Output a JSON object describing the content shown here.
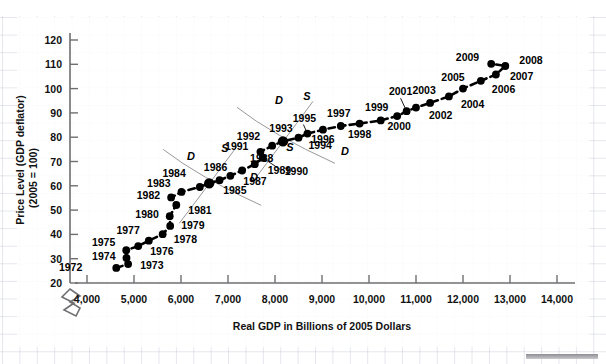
{
  "chart_data": {
    "type": "scatter",
    "title": "",
    "xlabel": "Real GDP in Billions of 2005 Dollars",
    "ylabel_line1": "Price Level (GDP deflator)",
    "ylabel_line2": "(2005 = 100)",
    "xlim": [
      3600,
      14600
    ],
    "ylim": [
      15,
      126
    ],
    "xticks": [
      4000,
      5000,
      6000,
      7000,
      8000,
      9000,
      10000,
      11000,
      12000,
      13000,
      14000
    ],
    "xtick_labels": [
      "4,000",
      "5,000",
      "6,000",
      "7,000",
      "8,000",
      "9,000",
      "10,000",
      "11,000",
      "12,000",
      "13,000",
      "14,000"
    ],
    "yticks": [
      20,
      30,
      40,
      50,
      60,
      70,
      80,
      90,
      100,
      110,
      120
    ],
    "ytick_labels": [
      "20",
      "30",
      "40",
      "50",
      "60",
      "70",
      "80",
      "90",
      "100",
      "110",
      "120"
    ],
    "grid": false,
    "axis_break_x": true,
    "legend": "none",
    "series_name": "US Real GDP vs Price Level, 1972-2009",
    "points": [
      {
        "year": "1972",
        "x": 4623,
        "y": 26.2,
        "lx": -34,
        "ly": 3,
        "anchor": "end",
        "big": false
      },
      {
        "year": "1973",
        "x": 4875,
        "y": 27.8,
        "lx": 12,
        "ly": 5,
        "anchor": "start",
        "big": false
      },
      {
        "year": "1974",
        "x": 4840,
        "y": 30.3,
        "lx": -11,
        "ly": 2,
        "anchor": "end",
        "big": false
      },
      {
        "year": "1975",
        "x": 4835,
        "y": 33.5,
        "lx": -11,
        "ly": -4,
        "anchor": "end",
        "big": false
      },
      {
        "year": "1976",
        "x": 5090,
        "y": 35.2,
        "lx": 12,
        "ly": 9,
        "anchor": "start",
        "big": false
      },
      {
        "year": "1977",
        "x": 5315,
        "y": 37.4,
        "lx": -9,
        "ly": -7,
        "anchor": "end",
        "big": false
      },
      {
        "year": "1978",
        "x": 5610,
        "y": 40.1,
        "lx": 11,
        "ly": 9,
        "anchor": "start",
        "big": false
      },
      {
        "year": "1979",
        "x": 5770,
        "y": 43.5,
        "lx": 11,
        "ly": 3,
        "anchor": "start",
        "big": false
      },
      {
        "year": "1980",
        "x": 5760,
        "y": 47.5,
        "lx": -11,
        "ly": 2,
        "anchor": "end",
        "big": false
      },
      {
        "year": "1981",
        "x": 5900,
        "y": 52.1,
        "lx": 12,
        "ly": 9,
        "anchor": "start",
        "big": false
      },
      {
        "year": "1982",
        "x": 5790,
        "y": 55.2,
        "lx": -11,
        "ly": 2,
        "anchor": "end",
        "big": false
      },
      {
        "year": "1983",
        "x": 6010,
        "y": 57.5,
        "lx": -11,
        "ly": -5,
        "anchor": "end",
        "big": false
      },
      {
        "year": "1984",
        "x": 6400,
        "y": 59.5,
        "lx": -14,
        "ly": -10,
        "anchor": "end",
        "big": false
      },
      {
        "year": "1985",
        "x": 6600,
        "y": 61.0,
        "lx": 14,
        "ly": 11,
        "anchor": "start",
        "big": true
      },
      {
        "year": "1986",
        "x": 6820,
        "y": 62.3,
        "lx": -4,
        "ly": -9,
        "anchor": "middle",
        "big": false
      },
      {
        "year": "1987",
        "x": 7050,
        "y": 64.1,
        "lx": 13,
        "ly": 9,
        "anchor": "start",
        "big": false
      },
      {
        "year": "1988",
        "x": 7300,
        "y": 66.3,
        "lx": 8,
        "ly": -8,
        "anchor": "start",
        "big": false
      },
      {
        "year": "1989",
        "x": 7570,
        "y": 68.9,
        "lx": 13,
        "ly": 10,
        "anchor": "start",
        "big": false
      },
      {
        "year": "1990",
        "x": 7740,
        "y": 71.5,
        "lx": 22,
        "ly": 17,
        "anchor": "start",
        "big": false
      },
      {
        "year": "1991",
        "x": 7690,
        "y": 74.0,
        "lx": -12,
        "ly": -2,
        "anchor": "end",
        "big": false
      },
      {
        "year": "1992",
        "x": 7940,
        "y": 76.5,
        "lx": -12,
        "ly": -6,
        "anchor": "end",
        "big": false
      },
      {
        "year": "1993",
        "x": 8170,
        "y": 78.3,
        "lx": -2,
        "ly": -9,
        "anchor": "middle",
        "big": true
      },
      {
        "year": "1994",
        "x": 8500,
        "y": 79.8,
        "lx": 10,
        "ly": 11,
        "anchor": "start",
        "big": false
      },
      {
        "year": "1995",
        "x": 8690,
        "y": 81.5,
        "lx": -3,
        "ly": -12,
        "anchor": "middle",
        "big": false
      },
      {
        "year": "1996",
        "x": 9020,
        "y": 83.1,
        "lx": 0,
        "ly": 13,
        "anchor": "middle",
        "big": false
      },
      {
        "year": "1997",
        "x": 9400,
        "y": 84.6,
        "lx": -2,
        "ly": -9,
        "anchor": "middle",
        "big": false
      },
      {
        "year": "1998",
        "x": 9800,
        "y": 85.6,
        "lx": 0,
        "ly": 14,
        "anchor": "middle",
        "big": false
      },
      {
        "year": "1999",
        "x": 10250,
        "y": 86.9,
        "lx": -4,
        "ly": -9,
        "anchor": "middle",
        "big": false
      },
      {
        "year": "2000",
        "x": 10600,
        "y": 88.7,
        "lx": 2,
        "ly": 14,
        "anchor": "middle",
        "big": false
      },
      {
        "year": "2001",
        "x": 10800,
        "y": 90.7,
        "lx": -6,
        "ly": -16,
        "anchor": "middle",
        "big": false
      },
      {
        "year": "2002",
        "x": 11000,
        "y": 92.2,
        "lx": 13,
        "ly": 11,
        "anchor": "start",
        "big": false
      },
      {
        "year": "2003",
        "x": 11300,
        "y": 94.1,
        "lx": -6,
        "ly": -9,
        "anchor": "middle",
        "big": false
      },
      {
        "year": "2004",
        "x": 11700,
        "y": 96.8,
        "lx": 12,
        "ly": 12,
        "anchor": "start",
        "big": false
      },
      {
        "year": "2005",
        "x": 12000,
        "y": 100.0,
        "lx": -10,
        "ly": -8,
        "anchor": "middle",
        "big": false
      },
      {
        "year": "2006",
        "x": 12380,
        "y": 103.2,
        "lx": 11,
        "ly": 12,
        "anchor": "start",
        "big": false
      },
      {
        "year": "2007",
        "x": 12700,
        "y": 105.8,
        "lx": 14,
        "ly": 5,
        "anchor": "start",
        "big": false
      },
      {
        "year": "2008",
        "x": 12900,
        "y": 109.3,
        "lx": 14,
        "ly": -2,
        "anchor": "start",
        "big": false
      },
      {
        "year": "2009",
        "x": 12600,
        "y": 110.2,
        "lx": -12,
        "ly": -3,
        "anchor": "end",
        "big": false
      }
    ],
    "curve_labels": [
      {
        "text": "D",
        "x": 191,
        "y": 160
      },
      {
        "text": "S",
        "x": 225,
        "y": 152
      },
      {
        "text": "D",
        "x": 254,
        "y": 181
      },
      {
        "text": "D",
        "x": 279,
        "y": 104
      },
      {
        "text": "S",
        "x": 307,
        "y": 100
      },
      {
        "text": "S",
        "x": 290,
        "y": 151
      },
      {
        "text": "D",
        "x": 345,
        "y": 155
      }
    ]
  },
  "footer": {
    "scrollbar_present": true
  }
}
